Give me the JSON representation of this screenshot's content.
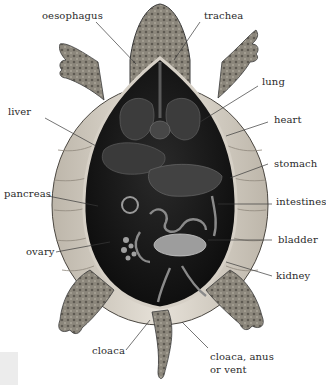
{
  "diagram": {
    "labels": [
      {
        "id": "oesophagus",
        "text": "oesophagus"
      },
      {
        "id": "trachea",
        "text": "trachea"
      },
      {
        "id": "lung",
        "text": "lung"
      },
      {
        "id": "liver",
        "text": "liver"
      },
      {
        "id": "heart",
        "text": "heart"
      },
      {
        "id": "stomach",
        "text": "stomach"
      },
      {
        "id": "pancreas",
        "text": "pancreas"
      },
      {
        "id": "intestines",
        "text": "intestines"
      },
      {
        "id": "bladder",
        "text": "bladder"
      },
      {
        "id": "ovary",
        "text": "ovary"
      },
      {
        "id": "kidney",
        "text": "kidney"
      },
      {
        "id": "cloaca",
        "text": "cloaca"
      },
      {
        "id": "cloaca_vent_line1",
        "text": "cloaca, anus"
      },
      {
        "id": "cloaca_vent_line2",
        "text": "or vent"
      }
    ],
    "colors": {
      "background": "#ffffff",
      "label_text": "#2a2a2a",
      "leader_line": "#3a3a3a",
      "shell_light": "#d8d2c8",
      "skin": "#8a8478",
      "body_cavity": "#121212",
      "organ": "#4a4a4a",
      "bladder": "#9a9a9a"
    }
  }
}
